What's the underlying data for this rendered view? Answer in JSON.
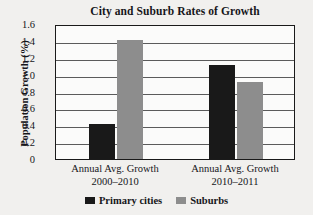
{
  "chart_data": {
    "type": "bar",
    "title": "City and Suburb Rates of Growth",
    "xlabel": "",
    "ylabel": "Population Growth (%)",
    "ylim": [
      0,
      1.6
    ],
    "ytick_labels": [
      "1.6",
      "1.4",
      "1.2",
      "1.0",
      "0.8",
      "0.6",
      "0.4",
      "0.2",
      "0"
    ],
    "ytick_values": [
      1.6,
      1.4,
      1.2,
      1.0,
      0.8,
      0.6,
      0.4,
      0.2,
      0
    ],
    "grid": true,
    "legend_position": "bottom",
    "categories": [
      {
        "line1": "Annual Avg. Growth",
        "line2": "2000–2010"
      },
      {
        "line1": "Annual Avg. Growth",
        "line2": "2010–2011"
      }
    ],
    "series": [
      {
        "name": "Primary cities",
        "color": "#191919",
        "values": [
          0.41,
          1.12
        ]
      },
      {
        "name": "Suburbs",
        "color": "#8d8d8d",
        "values": [
          1.41,
          0.91
        ]
      }
    ]
  },
  "colors": {
    "primary_cities": "#191919",
    "suburbs": "#8d8d8d",
    "axis": "#1a1a1a",
    "gridline": "#5b5b5b",
    "background": "#f1f0ee",
    "plot_background": "#fbfbfa",
    "text": "#16161a"
  }
}
